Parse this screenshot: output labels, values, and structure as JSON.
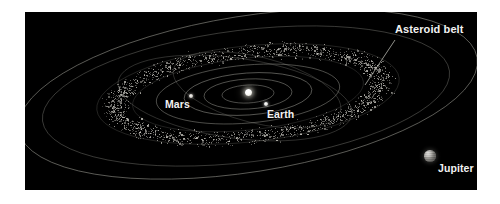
{
  "figure": {
    "background_color": "#000000",
    "page_color": "#ffffff",
    "canvas": {
      "x": 25,
      "y": 12,
      "width": 452,
      "height": 178
    }
  },
  "labels": {
    "asteroid_belt": "Asteroid belt",
    "mars": "Mars",
    "earth": "Earth",
    "jupiter": "Jupiter"
  },
  "bodies": [
    {
      "name": "sun",
      "label": "",
      "x": 223,
      "y": 80,
      "size": 7,
      "color": "#ffffff"
    },
    {
      "name": "earth",
      "label": "Earth",
      "x": 241,
      "y": 92,
      "size": 4.5,
      "color": "#e6e6e4"
    },
    {
      "name": "mars",
      "label": "Mars",
      "x": 166,
      "y": 84,
      "size": 4,
      "color": "#d8d5cf"
    },
    {
      "name": "jupiter",
      "label": "Jupiter",
      "x": 405,
      "y": 144,
      "size": 11.5,
      "color": "#b9b7b2"
    }
  ],
  "annotations": {
    "asteroid_belt_leader": {
      "from_x": 370,
      "from_y": 28,
      "to_x": 340,
      "to_y": 73
    }
  },
  "orbit_color": "#9a9a92",
  "belt_color": "#cfcdc6"
}
